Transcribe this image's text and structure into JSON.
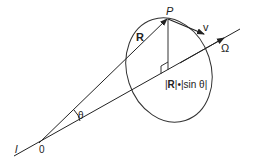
{
  "diagram": {
    "labels": {
      "point_p": "P",
      "velocity": "v",
      "radius_vector": "R",
      "angular_velocity": "Ω",
      "angle": "θ",
      "origin": "0",
      "axis": "l",
      "perp_distance_prefix": "|",
      "perp_distance_R": "R",
      "perp_distance_suffix": "|•|sin θ|"
    },
    "colors": {
      "stroke": "#222222",
      "background": "#ffffff"
    }
  }
}
